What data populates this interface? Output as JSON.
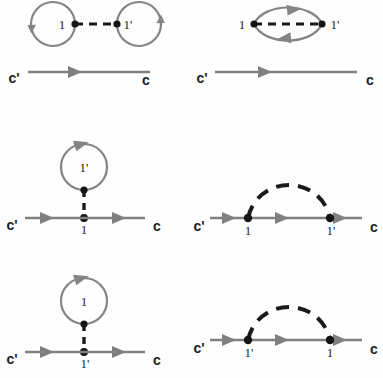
{
  "figure": {
    "kind": "feynman-diagram-set",
    "background_color": "#fefefe",
    "propagator_color": "#808080",
    "interaction_color": "#1a1a1a",
    "vertex_color": "#151515",
    "label_color": "#1d1d1d",
    "panel_count": 6
  },
  "labels": {
    "one": "1",
    "one_prime": "1'",
    "c_in": "c'",
    "c_out": "c"
  },
  "panels": [
    {
      "id": "panel-1",
      "name": "double-tadpole-disconnected",
      "row": 1,
      "column": 1,
      "left_loop_label": "1",
      "right_loop_label": "1'",
      "left_external": "c'",
      "right_external": "c",
      "interaction_style": "dashed-horizontal",
      "loop_arrow_directions": [
        "up-left",
        "down-right"
      ],
      "propagator_arrow_count": 1
    },
    {
      "id": "panel-2",
      "name": "bubble-lens-loop",
      "row": 1,
      "column": 2,
      "left_vertex_label": "1",
      "right_vertex_label": "1'",
      "left_external": "c'",
      "right_external": "c",
      "interaction_style": "dashed-horizontal",
      "loop_arrow_directions": [
        "right-top",
        "left-bottom"
      ],
      "propagator_arrow_count": 1
    },
    {
      "id": "panel-3",
      "name": "tadpole-self-energy-1prime-loop",
      "row": 2,
      "column": 1,
      "loop_label": "1'",
      "line_vertex_label": "1",
      "left_external": "c'",
      "right_external": "c",
      "interaction_style": "dashed-vertical",
      "loop_arrow_direction": "clockwise-top",
      "propagator_arrow_count": 2
    },
    {
      "id": "panel-4",
      "name": "rainbow-self-energy-1-to-1prime",
      "row": 2,
      "column": 2,
      "left_vertex_label": "1",
      "right_vertex_label": "1'",
      "left_external": "c'",
      "right_external": "c",
      "interaction_style": "dashed-arc",
      "propagator_arrow_count": 3
    },
    {
      "id": "panel-5",
      "name": "tadpole-self-energy-1-loop",
      "row": 3,
      "column": 1,
      "loop_label": "1",
      "line_vertex_label": "1'",
      "left_external": "c'",
      "right_external": "c",
      "interaction_style": "dashed-vertical",
      "loop_arrow_direction": "clockwise-top",
      "propagator_arrow_count": 2
    },
    {
      "id": "panel-6",
      "name": "rainbow-self-energy-1prime-to-1",
      "row": 3,
      "column": 2,
      "left_vertex_label": "1'",
      "right_vertex_label": "1",
      "left_external": "c'",
      "right_external": "c",
      "interaction_style": "dashed-arc",
      "propagator_arrow_count": 3
    }
  ]
}
